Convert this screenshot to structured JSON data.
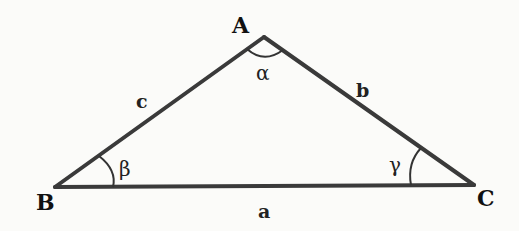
{
  "diagram": {
    "type": "triangle",
    "line_color": "#3a3a3a",
    "background": "#fbfbf9",
    "vertices": [
      {
        "id": "A",
        "label": "A",
        "x": 264,
        "y": 37,
        "label_x": 232,
        "label_y": 33
      },
      {
        "id": "B",
        "label": "B",
        "x": 55,
        "y": 187,
        "label_x": 36,
        "label_y": 210
      },
      {
        "id": "C",
        "label": "C",
        "x": 474,
        "y": 185,
        "label_x": 477,
        "label_y": 206
      }
    ],
    "sides": [
      {
        "id": "a",
        "label": "a",
        "from": "B",
        "to": "C",
        "label_x": 258,
        "label_y": 218
      },
      {
        "id": "b",
        "label": "b",
        "from": "A",
        "to": "C",
        "label_x": 356,
        "label_y": 97
      },
      {
        "id": "c",
        "label": "c",
        "from": "A",
        "to": "B",
        "label_x": 136,
        "label_y": 108
      }
    ],
    "angles": [
      {
        "id": "alpha",
        "label": "α",
        "vertex": "A",
        "label_x": 256,
        "label_y": 78
      },
      {
        "id": "beta",
        "label": "β",
        "vertex": "B",
        "label_x": 119,
        "label_y": 175
      },
      {
        "id": "gamma",
        "label": "γ",
        "vertex": "C",
        "label_x": 389,
        "label_y": 172
      }
    ]
  }
}
